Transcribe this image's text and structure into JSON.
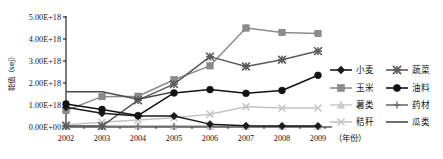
{
  "chart_data": {
    "type": "line",
    "title": "",
    "xlabel": "（年份）",
    "ylabel": "能值（sej）",
    "ylabel_chars": [
      "能",
      "值",
      "（",
      "s",
      "e",
      "j",
      "）"
    ],
    "x": [
      2002,
      2003,
      2004,
      2005,
      2006,
      2007,
      2008,
      2009
    ],
    "xtick_labels": [
      "2002",
      "2003",
      "2004",
      "2005",
      "2006",
      "2007",
      "2008",
      "2009"
    ],
    "ytick_labels": [
      "0.00E+00",
      "1.00E+18",
      "2.00E+18",
      "3.00E+18",
      "4.00E+18",
      "5.00E+18"
    ],
    "ytick_values": [
      0,
      1e+18,
      2e+18,
      3e+18,
      4e+18,
      5e+18
    ],
    "ylim": [
      0,
      5e+18
    ],
    "grid": false,
    "legend_position": "right",
    "series": [
      {
        "name": "小麦",
        "marker": "diamond",
        "color": "#1b1b1b",
        "values": [
          9e+17,
          6.2e+17,
          5e+17,
          5e+17,
          1.3e+17,
          6e+16,
          5e+16,
          5e+16
        ]
      },
      {
        "name": "玉米",
        "marker": "square",
        "color": "#8c8c8c",
        "values": [
          7.5e+17,
          1.38e+18,
          1.4e+18,
          2.15e+18,
          2.78e+18,
          4.5e+18,
          4.3e+18,
          4.25e+18
        ]
      },
      {
        "name": "薯类",
        "marker": "triangle",
        "color": "#cdcdcd",
        "values": [
          5e+16,
          4e+16,
          4e+16,
          4e+16,
          3e+16,
          3e+16,
          3e+16,
          3e+16
        ]
      },
      {
        "name": "秸秆",
        "marker": "x",
        "color": "#c3c3c3",
        "values": [
          1e+17,
          2.2e+17,
          3.2e+17,
          4.2e+17,
          5.8e+17,
          9.2e+17,
          8.6e+17,
          8.6e+17
        ]
      },
      {
        "name": "蔬菜",
        "marker": "star",
        "color": "#5a5a5a",
        "values": [
          5e+16,
          4e+16,
          1.22e+18,
          1.95e+18,
          3.2e+18,
          2.75e+18,
          3.06e+18,
          3.45e+18
        ]
      },
      {
        "name": "油料",
        "marker": "circle",
        "color": "#121212",
        "values": [
          1.05e+18,
          8e+17,
          5.2e+17,
          1.55e+18,
          1.7e+18,
          1.53e+18,
          1.66e+18,
          2.35e+18
        ]
      },
      {
        "name": "药材",
        "marker": "plus",
        "color": "#6e6e6e",
        "values": [
          2e+16,
          2e+16,
          2e+16,
          2e+16,
          2e+16,
          2e+16,
          2e+16,
          2e+16
        ]
      },
      {
        "name": "瓜类",
        "marker": "line",
        "color": "#4a4a4a",
        "values": [
          1.6e+18,
          1.6e+18,
          1.26e+18,
          1.6e+18,
          null,
          null,
          null,
          null
        ]
      }
    ]
  },
  "legend": {
    "entries": [
      {
        "label": "小麦",
        "marker": "diamond",
        "color": "#1b1b1b"
      },
      {
        "label": "蔬菜",
        "marker": "star",
        "color": "#5a5a5a"
      },
      {
        "label": "玉米",
        "marker": "square",
        "color": "#8c8c8c"
      },
      {
        "label": "油料",
        "marker": "circle",
        "color": "#121212"
      },
      {
        "label": "薯类",
        "marker": "triangle",
        "color": "#cdcdcd"
      },
      {
        "label": "药材",
        "marker": "plus",
        "color": "#6e6e6e"
      },
      {
        "label": "秸秆",
        "marker": "x",
        "color": "#c3c3c3"
      },
      {
        "label": "瓜类",
        "marker": "line",
        "color": "#4a4a4a"
      }
    ]
  },
  "axis_caption": "（年份）"
}
